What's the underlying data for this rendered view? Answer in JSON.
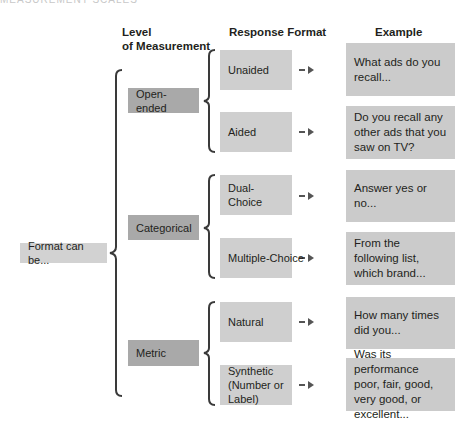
{
  "page_header_cutoff": "MEASUREMENT SCALES",
  "headers": {
    "level": "Level",
    "level_line2": "of Measurement",
    "response_format": "Response Format",
    "example": "Example"
  },
  "root": {
    "label": "Format can be..."
  },
  "levels": [
    {
      "label": "Open-ended"
    },
    {
      "label": "Categorical"
    },
    {
      "label": "Metric"
    }
  ],
  "responses": [
    {
      "label": "Unaided",
      "example": "What ads do you recall..."
    },
    {
      "label": "Aided",
      "example": "Do you recall any other ads that you saw on TV?"
    },
    {
      "label": "Dual-Choice",
      "example": "Answer yes or no..."
    },
    {
      "label": "Multiple-Choice",
      "example": "From the following list, which brand..."
    },
    {
      "label": "Natural",
      "example": "How many times did you..."
    },
    {
      "label": "Synthetic (Number or Label)",
      "example": "Was its performance poor, fair, good, very good, or excellent..."
    }
  ],
  "colors": {
    "root_box": "#d2d2d2",
    "level_box": "#a9a9a9",
    "response_box": "#cfcfcf",
    "example_box": "#cbcbcb",
    "bracket": "#3a3a3a",
    "arrow": "#555555"
  }
}
